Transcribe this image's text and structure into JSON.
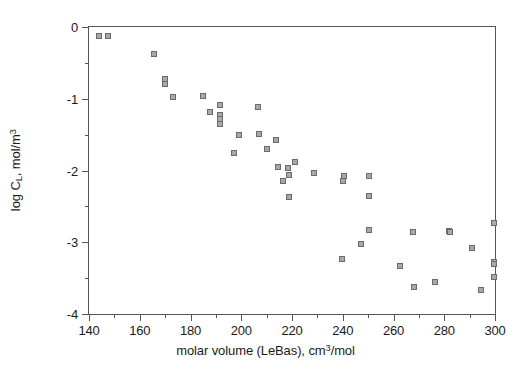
{
  "chart_data": {
    "type": "scatter",
    "title": "",
    "xlabel": "molar volume (LeBas), cm3/mol",
    "ylabel": "log CL, mol/m3",
    "xlabel_parts": {
      "pre": "molar volume (LeBas), cm",
      "sup": "3",
      "post": "/mol"
    },
    "ylabel_parts": {
      "pre": "log C",
      "sub": "L",
      "mid": ", mol/m",
      "sup": "3"
    },
    "xlim": [
      140,
      300
    ],
    "ylim": [
      -4,
      0
    ],
    "xticks": [
      140,
      160,
      180,
      200,
      220,
      240,
      260,
      280,
      300
    ],
    "xtick_labels": [
      "140",
      "160",
      "180",
      "200",
      "220",
      "240",
      "260",
      "280",
      "300"
    ],
    "xminor_step": 10,
    "yticks": [
      0,
      -1,
      -2,
      -3,
      -4
    ],
    "ytick_labels": [
      "0",
      "-1",
      "-2",
      "-3",
      "-4"
    ],
    "yminor_step": 0.5,
    "grid": false,
    "legend": null,
    "marker": {
      "shape": "square",
      "fill": "#a8a8a8",
      "edge": "#6a6a6a",
      "size_px": 6
    },
    "frame_color": "#555555",
    "background": "#ffffff",
    "points": [
      {
        "x": 144.0,
        "y": -0.12
      },
      {
        "x": 147.5,
        "y": -0.12
      },
      {
        "x": 165.8,
        "y": -0.38
      },
      {
        "x": 169.8,
        "y": -0.73
      },
      {
        "x": 169.8,
        "y": -0.8
      },
      {
        "x": 173.0,
        "y": -0.98
      },
      {
        "x": 185.0,
        "y": -0.96
      },
      {
        "x": 187.7,
        "y": -1.18
      },
      {
        "x": 191.8,
        "y": -1.09
      },
      {
        "x": 191.8,
        "y": -1.22
      },
      {
        "x": 191.8,
        "y": -1.28
      },
      {
        "x": 191.8,
        "y": -1.35
      },
      {
        "x": 197.2,
        "y": -1.76
      },
      {
        "x": 199.3,
        "y": -1.51
      },
      {
        "x": 206.7,
        "y": -1.11
      },
      {
        "x": 206.8,
        "y": -1.49
      },
      {
        "x": 210.3,
        "y": -1.7
      },
      {
        "x": 213.8,
        "y": -1.58
      },
      {
        "x": 214.5,
        "y": -1.95
      },
      {
        "x": 216.6,
        "y": -2.14
      },
      {
        "x": 218.5,
        "y": -1.97
      },
      {
        "x": 218.8,
        "y": -2.06
      },
      {
        "x": 218.8,
        "y": -2.37
      },
      {
        "x": 221.3,
        "y": -1.88
      },
      {
        "x": 228.8,
        "y": -2.03
      },
      {
        "x": 239.6,
        "y": -3.23
      },
      {
        "x": 240.0,
        "y": -2.15
      },
      {
        "x": 240.5,
        "y": -2.08
      },
      {
        "x": 247.3,
        "y": -3.02
      },
      {
        "x": 250.5,
        "y": -2.08
      },
      {
        "x": 250.5,
        "y": -2.36
      },
      {
        "x": 250.5,
        "y": -2.83
      },
      {
        "x": 262.4,
        "y": -3.33
      },
      {
        "x": 267.8,
        "y": -2.86
      },
      {
        "x": 268.0,
        "y": -3.62
      },
      {
        "x": 276.2,
        "y": -3.55
      },
      {
        "x": 281.9,
        "y": -2.84
      },
      {
        "x": 282.3,
        "y": -2.86
      },
      {
        "x": 290.9,
        "y": -3.08
      },
      {
        "x": 294.6,
        "y": -3.67
      },
      {
        "x": 299.6,
        "y": -2.73
      },
      {
        "x": 299.6,
        "y": -3.27
      },
      {
        "x": 299.6,
        "y": -3.3
      },
      {
        "x": 299.6,
        "y": -3.48
      }
    ]
  }
}
